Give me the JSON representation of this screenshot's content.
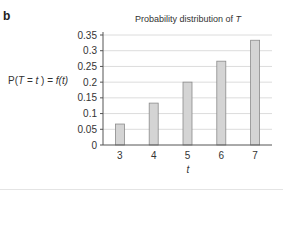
{
  "panel_label": "b",
  "chart_data": {
    "type": "bar",
    "title": "Probability distribution of T",
    "title_parts": {
      "prefix": "Probability distribution of ",
      "variable": "T"
    },
    "xlabel": "t",
    "ylabel": "P(T = t ) = f(t)",
    "ylabel_parts": {
      "p": "P(",
      "T": "T",
      "eq": " = ",
      "t": "t",
      "close": " ) = ",
      "f": "f(t)"
    },
    "categories": [
      "3",
      "4",
      "5",
      "6",
      "7"
    ],
    "values": [
      0.0667,
      0.1333,
      0.2,
      0.2667,
      0.3333
    ],
    "yticks": [
      "0",
      "0.05",
      "0.1",
      "0.15",
      "0.2",
      "0.25",
      "0.3",
      "0.35"
    ],
    "ylim": [
      0,
      0.35
    ],
    "grid": true,
    "legend": null,
    "bar_color": "#d4d4d4",
    "bar_edge_color": "#8a8a8a"
  }
}
